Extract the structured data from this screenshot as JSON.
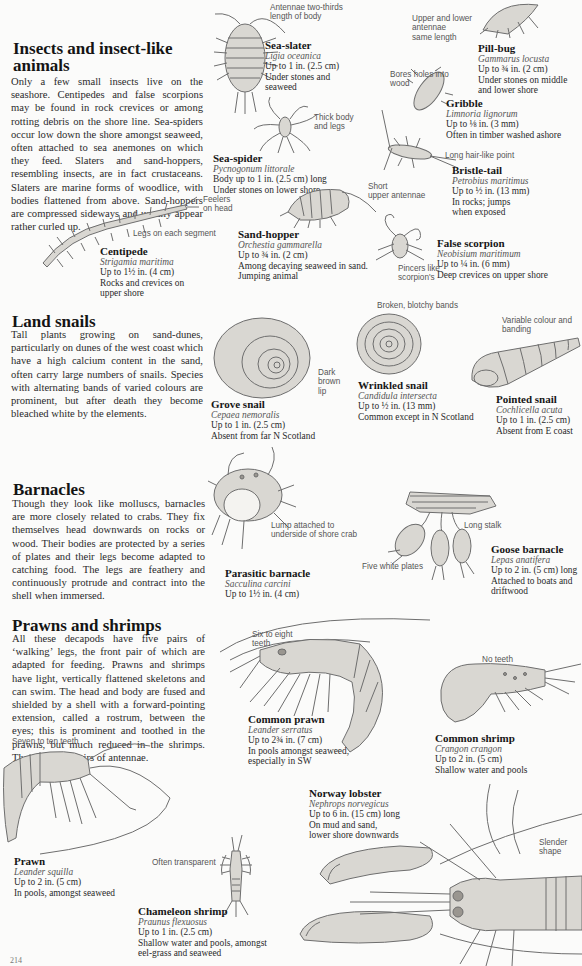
{
  "sections": {
    "insects": {
      "heading": "Insects and insect-like animals",
      "heading_line1": "Insects and insect-like",
      "heading_line2": "animals",
      "body": "Only a few small insects live on the seashore. Centipedes and false scorpions may be found in rock crevices or among rotting debris on the shore line. Sea-spiders occur low down the shore amongst seaweed, often attached to sea anemones on which they feed. Slaters and sand-hoppers, resembling insects, are in fact crustaceans. Slaters are marine forms of woodlice, with bodies flattened from above. Sand-hoppers are compressed sideways and usually appear rather curled up."
    },
    "land_snails": {
      "heading": "Land snails",
      "body": "Tall plants growing on sand-dunes, particularly on dunes of the west coast which have a high calcium content in the sand, often carry large numbers of snails. Species with alternating bands of varied colours are prominent, but after death they become bleached white by the elements."
    },
    "barnacles": {
      "heading": "Barnacles",
      "body": "Though they look like molluscs, barnacles are more closely related to crabs. They fix themselves head downwards on rocks or wood. Their bodies are protected by a series of plates and their legs become adapted to catching food. The legs are feathery and continuously protrude and contract into the shell when immersed."
    },
    "prawns": {
      "heading": "Prawns and shrimps",
      "body": "All these decapods have five pairs of ‘walking’ legs, the front pair of which are adapted for feeding. Prawns and shrimps have light, vertically flattened skeletons and can swim. The head and body are fused and shielded by a shell with a forward-pointing extension, called a rostrum, between the eyes; this is prominent and toothed in the prawns, but much reduced in the shrimps. There are two pairs of antennae."
    }
  },
  "species": {
    "sea_slater": {
      "name": "Sea-slater",
      "latin": "Ligia oceanica",
      "size": "Up to 1 in. (2.5 cm)",
      "habitat1": "Under stones and",
      "habitat2": "seaweed"
    },
    "pill_bug": {
      "name": "Pill-bug",
      "latin": "Gammarus locusta",
      "size": "Up to ¾ in. (2 cm)",
      "habitat1": "Under stones on middle",
      "habitat2": "and lower shore"
    },
    "gribble": {
      "name": "Gribble",
      "latin": "Limnoria lignorum",
      "size": "Up to ⅛ in. (3 mm)",
      "habitat1": "Often in timber washed ashore"
    },
    "sea_spider": {
      "name": "Sea-spider",
      "latin": "Pycnogonum littorale",
      "size": "Body up to 1 in. (2.5 cm) long",
      "habitat1": "Under stones on lower shore"
    },
    "bristle_tail": {
      "name": "Bristle-tail",
      "latin": "Petrobius maritimus",
      "size": "Up to ½ in. (13 mm)",
      "habitat1": "In rocks; jumps",
      "habitat2": "when exposed"
    },
    "sand_hopper": {
      "name": "Sand-hopper",
      "latin": "Orchestia gammarella",
      "size": "Up to ¾ in. (2 cm)",
      "habitat1": "Among decaying seaweed in sand.",
      "habitat2": "Jumping animal"
    },
    "centipede": {
      "name": "Centipede",
      "latin": "Strigamia maritima",
      "size": "Up to 1½ in. (4 cm)",
      "habitat1": "Rocks and crevices on",
      "habitat2": "upper shore"
    },
    "false_scorpion": {
      "name": "False scorpion",
      "latin": "Neobisium maritimum",
      "size": "Up to ¼ in. (6 mm)",
      "habitat1": "Deep crevices on upper shore"
    },
    "grove_snail": {
      "name": "Grove snail",
      "latin": "Cepaea nemoralis",
      "size": "Up to 1 in. (2.5 cm)",
      "habitat1": "Absent from far N Scotland"
    },
    "wrinkled_snail": {
      "name": "Wrinkled snail",
      "latin": "Candidula intersecta",
      "size": "Up to ½ in. (13 mm)",
      "habitat1": "Common except in N Scotland"
    },
    "pointed_snail": {
      "name": "Pointed snail",
      "latin": "Cochlicella acuta",
      "size": "Up to 1 in. (2.5 cm)",
      "habitat1": "Absent from E coast"
    },
    "parasitic_barnacle": {
      "name": "Parasitic barnacle",
      "latin": "Sacculina carcini",
      "size": "Up to 1½ in. (4 cm)"
    },
    "goose_barnacle": {
      "name": "Goose barnacle",
      "latin": "Lepas anatifera",
      "size": "Up to 2 in. (5 cm) long",
      "habitat1": "Attached to boats and",
      "habitat2": "driftwood"
    },
    "common_prawn": {
      "name": "Common prawn",
      "latin": "Leander serratus",
      "size": "Up to 2¾ in. (7 cm)",
      "habitat1": "In pools amongst seaweed,",
      "habitat2": "especially in SW"
    },
    "common_shrimp": {
      "name": "Common shrimp",
      "latin": "Crangon crangon",
      "size": "Up to 2 in. (5 cm)",
      "habitat1": "Shallow water and pools"
    },
    "prawn": {
      "name": "Prawn",
      "latin": "Leander squilla",
      "size": "Up to 2 in. (5 cm)",
      "habitat1": "In pools, amongst seaweed"
    },
    "chameleon_shrimp": {
      "name": "Chameleon shrimp",
      "latin": "Praunus flexuosus",
      "size": "Up to 1 in. (2.5 cm)",
      "habitat1": "Shallow water and pools, amongst",
      "habitat2": "eel-grass and seaweed"
    },
    "norway_lobster": {
      "name": "Norway lobster",
      "latin": "Nephrops norvegicus",
      "size": "Up to 6 in. (15 cm) long",
      "habitat1": "On mud and sand,",
      "habitat2": "lower shore downwards"
    }
  },
  "callouts": {
    "antennae_two_thirds_1": "Antennae two-thirds",
    "antennae_two_thirds_2": "length of body",
    "upper_lower_antennae_1": "Upper and lower",
    "upper_lower_antennae_2": "antennae",
    "upper_lower_antennae_3": "same length",
    "bores_holes_1": "Bores holes into",
    "bores_holes_2": "wood",
    "thick_body_1": "Thick body",
    "thick_body_2": "and legs",
    "long_hair_point": "Long hair-like point",
    "short_upper_antennae_1": "Short",
    "short_upper_antennae_2": "upper antennae",
    "feelers_on_head_1": "Feelers",
    "feelers_on_head_2": "on head",
    "legs_each_segment": "Legs on each segment",
    "pincers_scorpion_1": "Pincers like",
    "pincers_scorpion_2": "scorpion's",
    "broken_blotchy_bands": "Broken, blotchy bands",
    "variable_colour_1": "Variable colour and",
    "variable_colour_2": "banding",
    "dark_brown_lip_1": "Dark",
    "dark_brown_lip_2": "brown",
    "dark_brown_lip_3": "lip",
    "lump_attached_1": "Lump attached to",
    "lump_attached_2": "underside of shore crab",
    "long_stalk": "Long stalk",
    "five_white_plates": "Five white plates",
    "six_eight_teeth_1": "Six to eight",
    "six_eight_teeth_2": "teeth",
    "no_teeth": "No teeth",
    "seven_ten_teeth": "Seven to ten teeth",
    "often_transparent": "Often transparent",
    "slender_shape_1": "Slender",
    "slender_shape_2": "shape"
  },
  "page_number": "214"
}
